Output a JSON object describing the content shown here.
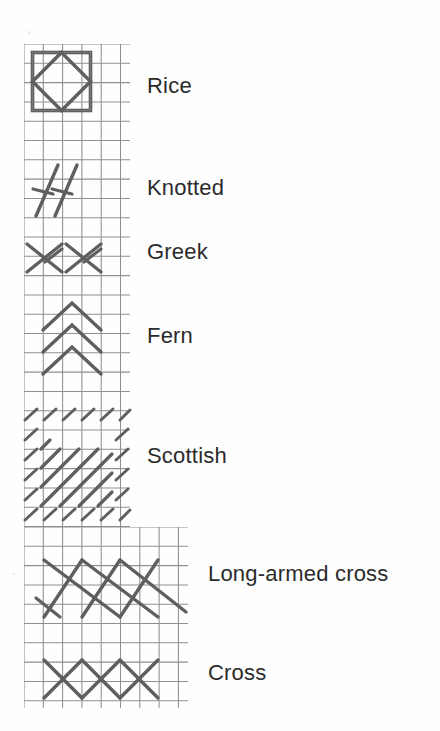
{
  "page": {
    "background_color": "#fefefe",
    "ink_color": "#5c5c5c",
    "grid_color": "#8c8c8c",
    "text_color": "#2b2b2b"
  },
  "grid": {
    "cell_size": 19.3,
    "upper": {
      "x": 24,
      "y": 44,
      "width": 106,
      "height": 483,
      "cols": 5.5,
      "rows": 25
    },
    "lower": {
      "x": 24,
      "y": 527,
      "width": 164,
      "height": 181,
      "cols": 8.5,
      "rows": 9.4
    }
  },
  "stitches": [
    {
      "name": "Rice",
      "label": "Rice",
      "label_x": 147,
      "label_y": 75,
      "diagram": "square-with-inscribed-diamond",
      "description": "Large square cross over two by two squares with a diamond of back stitches tying each corner"
    },
    {
      "name": "Knotted",
      "label": "Knotted",
      "label_x": 147,
      "label_y": 177,
      "diagram": "two-long-diagonals-with-short-tie-bars",
      "description": "Long slanting stitch crossed near its lower end by a short tying stitch"
    },
    {
      "name": "Greek",
      "label": "Greek",
      "label_x": 147,
      "label_y": 241,
      "diagram": "two-asymmetric-crosses",
      "description": "Plaited row of asymmetric crossed stitches worked sideways"
    },
    {
      "name": "Fern",
      "label": "Fern",
      "label_x": 147,
      "label_y": 325,
      "diagram": "three-stacked-chevrons",
      "description": "Pairs of slanting stitches meeting at a centre point, stacked in a vertical column"
    },
    {
      "name": "Scottish",
      "label": "Scottish",
      "label_x": 147,
      "label_y": 445,
      "diagram": "diagonal-block-framed-by-tent-stitches",
      "description": "Blocks of graduated diagonal stitches framed all round by rows of small tent stitches"
    },
    {
      "name": "Long-armed cross",
      "label": "Long-armed cross",
      "label_x": 208,
      "label_y": 563,
      "diagram": "row-of-long-armed-crosses",
      "description": "Crossed stitches in which one arm is extended over twice the width of the other"
    },
    {
      "name": "Cross",
      "label": "Cross",
      "label_x": 208,
      "label_y": 662,
      "diagram": "row-of-three-cross-stitches",
      "description": "Row of three simple cross stitches each worked over one square"
    }
  ]
}
